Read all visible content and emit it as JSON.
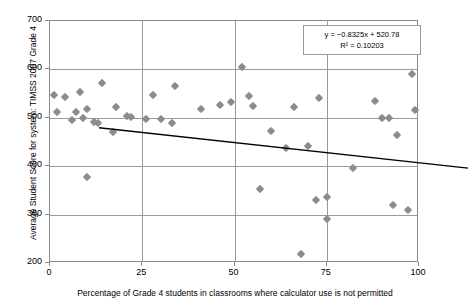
{
  "chart_data": {
    "type": "scatter",
    "title": "",
    "xlabel": "Percentage of Grade 4 students in classrooms where calculator use is not permitted",
    "ylabel": "Average Student Score for system: TIMSS 2007 Grade 4",
    "xlim": [
      0,
      100
    ],
    "ylim": [
      200,
      700
    ],
    "xticks": [
      "0",
      "25",
      "50",
      "75",
      "100"
    ],
    "xtick_values": [
      0,
      25,
      50,
      75,
      100
    ],
    "yticks": [
      "200",
      "300",
      "400",
      "500",
      "600",
      "700"
    ],
    "ytick_values": [
      200,
      300,
      400,
      500,
      600,
      700
    ],
    "grid": "horizontal-and-vertical",
    "legend": "none",
    "marker": "diamond",
    "marker_color": "#8c8c8c",
    "trendline": {
      "type": "linear",
      "slope": -0.8325,
      "intercept": 520.78,
      "r_squared": 0.10203,
      "equation_label": "y = −0.8325x + 520.78",
      "r2_label": "R² = 0.10203",
      "color": "#000000",
      "x_start": 0,
      "y_start": 520.78,
      "x_end": 100,
      "y_end": 437.53
    },
    "points": [
      {
        "x": 1,
        "y": 547
      },
      {
        "x": 2,
        "y": 511
      },
      {
        "x": 4,
        "y": 542
      },
      {
        "x": 6,
        "y": 496
      },
      {
        "x": 7,
        "y": 513
      },
      {
        "x": 8,
        "y": 553
      },
      {
        "x": 9,
        "y": 500
      },
      {
        "x": 10,
        "y": 519
      },
      {
        "x": 10,
        "y": 378
      },
      {
        "x": 12,
        "y": 492
      },
      {
        "x": 13,
        "y": 490
      },
      {
        "x": 14,
        "y": 571
      },
      {
        "x": 17,
        "y": 470
      },
      {
        "x": 18,
        "y": 522
      },
      {
        "x": 21,
        "y": 504
      },
      {
        "x": 22,
        "y": 501
      },
      {
        "x": 26,
        "y": 497
      },
      {
        "x": 28,
        "y": 548
      },
      {
        "x": 30,
        "y": 497
      },
      {
        "x": 33,
        "y": 489
      },
      {
        "x": 34,
        "y": 566
      },
      {
        "x": 41,
        "y": 519
      },
      {
        "x": 46,
        "y": 526
      },
      {
        "x": 49,
        "y": 533
      },
      {
        "x": 52,
        "y": 604
      },
      {
        "x": 54,
        "y": 546
      },
      {
        "x": 55,
        "y": 525
      },
      {
        "x": 57,
        "y": 352
      },
      {
        "x": 60,
        "y": 472
      },
      {
        "x": 64,
        "y": 437
      },
      {
        "x": 66,
        "y": 522
      },
      {
        "x": 68,
        "y": 218
      },
      {
        "x": 70,
        "y": 442
      },
      {
        "x": 72,
        "y": 330
      },
      {
        "x": 73,
        "y": 541
      },
      {
        "x": 75,
        "y": 336
      },
      {
        "x": 75,
        "y": 290
      },
      {
        "x": 82,
        "y": 396
      },
      {
        "x": 88,
        "y": 534
      },
      {
        "x": 90,
        "y": 500
      },
      {
        "x": 92,
        "y": 500
      },
      {
        "x": 93,
        "y": 320
      },
      {
        "x": 94,
        "y": 464
      },
      {
        "x": 97,
        "y": 309
      },
      {
        "x": 98,
        "y": 591
      },
      {
        "x": 99,
        "y": 516
      }
    ]
  }
}
